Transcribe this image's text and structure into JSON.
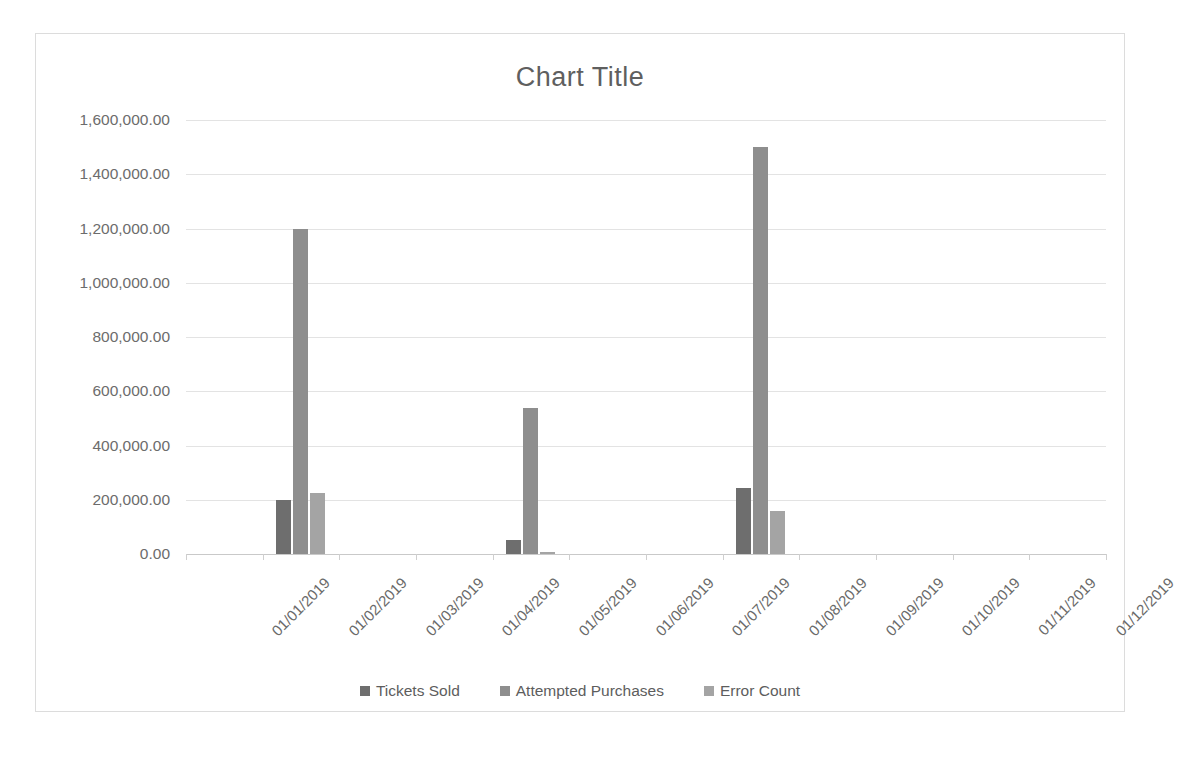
{
  "chart": {
    "title": "Chart Title",
    "border_color": "#dcdcdc",
    "background": "#ffffff"
  },
  "legend": {
    "position": "bottom",
    "entries": [
      {
        "label": "Tickets Sold",
        "color": "#6e6e6e"
      },
      {
        "label": "Attempted Purchases",
        "color": "#8e8e8e"
      },
      {
        "label": "Error Count",
        "color": "#a4a4a4"
      }
    ]
  },
  "yaxis": {
    "ticks": [
      "0.00",
      "200,000.00",
      "400,000.00",
      "600,000.00",
      "800,000.00",
      "1,000,000.00",
      "1,200,000.00",
      "1,400,000.00",
      "1,600,000.00"
    ]
  },
  "chart_data": {
    "type": "bar",
    "title": "Chart Title",
    "xlabel": "",
    "ylabel": "",
    "ylim": [
      0,
      1600000
    ],
    "ytick_step": 200000,
    "grid": true,
    "legend_position": "bottom",
    "categories": [
      "01/01/2019",
      "01/02/2019",
      "01/03/2019",
      "01/04/2019",
      "01/05/2019",
      "01/06/2019",
      "01/07/2019",
      "01/08/2019",
      "01/09/2019",
      "01/10/2019",
      "01/11/2019",
      "01/12/2019"
    ],
    "series": [
      {
        "name": "Tickets Sold",
        "color": "#6e6e6e",
        "values": [
          0,
          200000,
          0,
          0,
          50000,
          0,
          0,
          245000,
          0,
          0,
          0,
          0
        ]
      },
      {
        "name": "Attempted Purchases",
        "color": "#8e8e8e",
        "values": [
          0,
          1200000,
          0,
          0,
          540000,
          0,
          0,
          1500000,
          0,
          0,
          0,
          0
        ]
      },
      {
        "name": "Error Count",
        "color": "#a4a4a4",
        "values": [
          0,
          225000,
          0,
          0,
          8000,
          0,
          0,
          160000,
          0,
          0,
          0,
          0
        ]
      }
    ]
  }
}
